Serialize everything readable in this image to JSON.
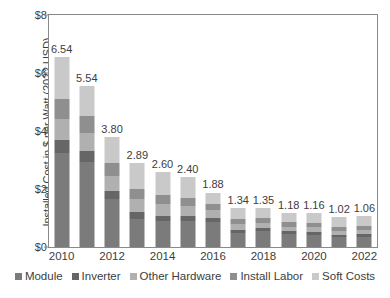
{
  "chart_data": {
    "type": "bar",
    "stacked": true,
    "title": "",
    "xlabel": "",
    "ylabel": "Installed Cost in $ per Watt (2022 USD)",
    "ylim": [
      0,
      8
    ],
    "ytick_labels": [
      "$0",
      "$2",
      "$4",
      "$6",
      "$8"
    ],
    "ytick_values": [
      0,
      2,
      4,
      6,
      8
    ],
    "grid": false,
    "legend_position": "bottom",
    "categories": [
      2010,
      2011,
      2012,
      2013,
      2014,
      2015,
      2016,
      2017,
      2018,
      2019,
      2020,
      2021,
      2022
    ],
    "xtick_labels": [
      "2010",
      "2012",
      "2014",
      "2016",
      "2018",
      "2020",
      "2022"
    ],
    "xtick_categories": [
      2010,
      2012,
      2014,
      2016,
      2018,
      2020,
      2022
    ],
    "totals": [
      6.54,
      5.54,
      3.8,
      2.89,
      2.6,
      2.4,
      1.88,
      1.34,
      1.35,
      1.18,
      1.16,
      1.02,
      1.06
    ],
    "total_labels": [
      "6.54",
      "5.54",
      "3.80",
      "2.89",
      "2.60",
      "2.40",
      "1.88",
      "1.34",
      "1.35",
      "1.18",
      "1.16",
      "1.02",
      "1.06"
    ],
    "series": [
      {
        "name": "Module",
        "color": "#7b7b7b",
        "values": [
          3.23,
          2.94,
          1.67,
          0.98,
          0.88,
          0.88,
          0.86,
          0.47,
          0.55,
          0.44,
          0.42,
          0.34,
          0.36
        ]
      },
      {
        "name": "Inverter",
        "color": "#666666",
        "values": [
          0.46,
          0.38,
          0.27,
          0.22,
          0.19,
          0.18,
          0.15,
          0.11,
          0.11,
          0.1,
          0.1,
          0.09,
          0.09
        ]
      },
      {
        "name": "Other Hardware",
        "color": "#b0b0b0",
        "values": [
          0.72,
          0.62,
          0.52,
          0.45,
          0.4,
          0.35,
          0.26,
          0.2,
          0.18,
          0.16,
          0.16,
          0.14,
          0.14
        ]
      },
      {
        "name": "Install Labor",
        "color": "#8f8f8f",
        "values": [
          0.68,
          0.58,
          0.44,
          0.36,
          0.31,
          0.28,
          0.22,
          0.17,
          0.17,
          0.15,
          0.15,
          0.13,
          0.14
        ]
      },
      {
        "name": "Soft Costs",
        "color": "#c9c9c9",
        "values": [
          1.45,
          1.02,
          0.9,
          0.88,
          0.82,
          0.71,
          0.39,
          0.39,
          0.34,
          0.33,
          0.33,
          0.32,
          0.33
        ]
      }
    ]
  },
  "legend": {
    "items": [
      {
        "label": "Module",
        "color": "#7b7b7b"
      },
      {
        "label": "Inverter",
        "color": "#666666"
      },
      {
        "label": "Other Hardware",
        "color": "#b0b0b0"
      },
      {
        "label": "Install Labor",
        "color": "#8f8f8f"
      },
      {
        "label": "Soft Costs",
        "color": "#c9c9c9"
      }
    ]
  }
}
